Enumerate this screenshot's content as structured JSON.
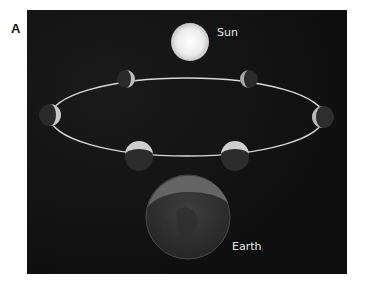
{
  "figure": {
    "panel_label": "A",
    "labels": {
      "sun": "Sun",
      "earth": "Earth"
    },
    "colors": {
      "background": "#101010",
      "orbit": "#d8d8d8",
      "sun": "#f2f2f2",
      "moon_dark": "#2a2a2a",
      "moon_lit": "#c8c8c8",
      "earth": "#3a3a3a"
    },
    "moons": [
      {
        "name": "moon-top-left",
        "cx": 99,
        "cy": 69,
        "r": 9
      },
      {
        "name": "moon-top-right",
        "cx": 222,
        "cy": 69,
        "r": 9
      },
      {
        "name": "moon-left",
        "cx": 23,
        "cy": 105,
        "r": 11
      },
      {
        "name": "moon-right",
        "cx": 296,
        "cy": 107,
        "r": 11
      },
      {
        "name": "moon-bottom-left",
        "cx": 112,
        "cy": 147,
        "r": 14
      },
      {
        "name": "moon-bottom-right",
        "cx": 208,
        "cy": 147,
        "r": 14
      }
    ]
  }
}
